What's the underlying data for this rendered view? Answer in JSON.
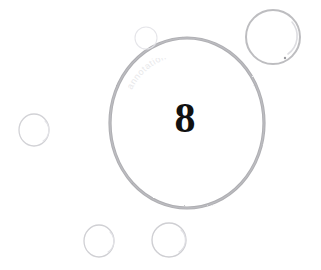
{
  "scene": {
    "kind": "scanned-bubbles-image",
    "background_color": "#ffffff",
    "page_width": 321,
    "page_height": 270,
    "main_label": "8",
    "watermark_text": "annotation",
    "ink_color": "#a9a9ad",
    "ink_color_light": "#d8d8dc",
    "ink_color_faint": "#ececf0",
    "numeral_color": "#111111"
  },
  "bubbles": [
    {
      "name": "main-bubble",
      "label": "8",
      "cx": 187,
      "cy": 123,
      "rx": 77,
      "ry": 85,
      "stroke": "#a9a9ad",
      "stroke_width": 3.2
    },
    {
      "name": "top-right-bubble",
      "label": "",
      "cx": 273,
      "cy": 37,
      "rx": 27,
      "ry": 27,
      "stroke": "#b7b7bb",
      "stroke_width": 2.0
    },
    {
      "name": "left-bubble",
      "label": "",
      "cx": 34,
      "cy": 130,
      "rx": 15,
      "ry": 16,
      "stroke": "#d2d2d6",
      "stroke_width": 1.3
    },
    {
      "name": "bottom-left-bubble",
      "label": "",
      "cx": 99,
      "cy": 241,
      "rx": 15,
      "ry": 16,
      "stroke": "#d0d0d4",
      "stroke_width": 1.3
    },
    {
      "name": "bottom-right-bubble",
      "label": "",
      "cx": 169,
      "cy": 240,
      "rx": 17,
      "ry": 17,
      "stroke": "#cfcfd3",
      "stroke_width": 1.4
    },
    {
      "name": "top-small-bubble",
      "label": "",
      "cx": 146,
      "cy": 38,
      "rx": 11,
      "ry": 11,
      "stroke": "#e4e4e8",
      "stroke_width": 1.1
    }
  ],
  "highlights": [
    {
      "name": "top-right-bubble-highlight",
      "cx": 273,
      "cy": 37,
      "rx": 22,
      "ry": 22,
      "stroke": "#ddddE1"
    },
    {
      "name": "left-bubble-highlight",
      "cx": 34,
      "cy": 130,
      "rx": 12,
      "ry": 13,
      "stroke": "#e4e4e8"
    },
    {
      "name": "bottom-left-bubble-highlight",
      "cx": 99,
      "cy": 241,
      "rx": 12,
      "ry": 13,
      "stroke": "#e2e2e6"
    },
    {
      "name": "bottom-right-bubble-highlight",
      "cx": 169,
      "cy": 240,
      "rx": 13,
      "ry": 14,
      "stroke": "#e0e0e4"
    }
  ],
  "speck": {
    "name": "ink-speck",
    "cx": 285,
    "cy": 58,
    "r": 1.2,
    "color": "#9a9a9e"
  }
}
